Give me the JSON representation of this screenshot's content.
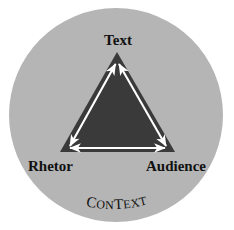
{
  "figure": {
    "canvas": {
      "width": 234,
      "height": 230,
      "background": "#ffffff"
    },
    "circle": {
      "name": "context-circle",
      "cx": 116,
      "cy": 115,
      "r": 107,
      "fill": "#b5b5b5"
    },
    "triangle": {
      "name": "rhetorical-triangle",
      "fill": "#3a3a3a",
      "points": "117,52 175,152 60,152",
      "apex": {
        "x": 117,
        "y": 52
      },
      "bottom_left": {
        "x": 60,
        "y": 152
      },
      "bottom_right": {
        "x": 175,
        "y": 152
      }
    },
    "arrow_color": "#ffffff",
    "arrows": [
      {
        "name": "arrow-rhetor-text",
        "from": "Rhetor",
        "to": "Text",
        "double_headed": true
      },
      {
        "name": "arrow-text-audience",
        "from": "Text",
        "to": "Audience",
        "double_headed": true
      },
      {
        "name": "arrow-rhetor-audience",
        "from": "Rhetor",
        "to": "Audience",
        "double_headed": true
      }
    ],
    "labels": {
      "text": "Text",
      "rhetor": "Rhetor",
      "audience": "Audience",
      "context": "CONTEXT"
    },
    "context_letters": [
      "C",
      "O",
      "N",
      "T",
      "E",
      "X",
      "T"
    ]
  }
}
